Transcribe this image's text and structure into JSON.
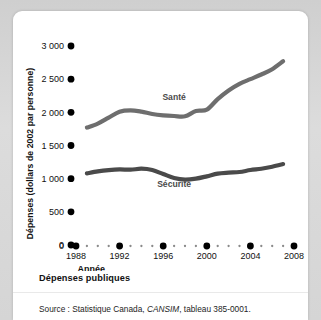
{
  "card": {
    "title": "Dépenses publiques",
    "source_prefix": "Source : Statistique Canada, ",
    "source_italic": "CANSIM",
    "source_suffix": ", tableau 385-0001."
  },
  "chart_data": {
    "type": "line",
    "title": "Dépenses publiques",
    "xlabel": "Année",
    "ylabel": "Dépenses (dollars de 2002 par personne)",
    "xlim": [
      1988,
      2008
    ],
    "ylim": [
      0,
      3000
    ],
    "ytick_labels": [
      "0",
      "500",
      "1 000",
      "1 500",
      "2 000",
      "2 500",
      "3 000"
    ],
    "ytick_values": [
      0,
      500,
      1000,
      1500,
      2000,
      2500,
      3000
    ],
    "xtick_labels": [
      "1988",
      "1992",
      "1996",
      "2000",
      "2004",
      "2008"
    ],
    "xtick_values": [
      1988,
      1992,
      1996,
      2000,
      2004,
      2008
    ],
    "grid": false,
    "legend_position": "inline-labels",
    "marker_style": "dot-ticks",
    "series": [
      {
        "name": "Santé",
        "color": "#6e6e6e",
        "label_x": 1997,
        "label_y": 2180,
        "x": [
          1989,
          1990,
          1991,
          1992,
          1993,
          1994,
          1995,
          1996,
          1997,
          1998,
          1999,
          2000,
          2001,
          2002,
          2003,
          2004,
          2005,
          2006,
          2007
        ],
        "values": [
          1770,
          1830,
          1920,
          2010,
          2030,
          2010,
          1975,
          1955,
          1945,
          1940,
          2020,
          2040,
          2200,
          2330,
          2430,
          2500,
          2570,
          2650,
          2770
        ]
      },
      {
        "name": "Sécurité",
        "color": "#4a4a4a",
        "label_x": 1997,
        "label_y": 870,
        "x": [
          1989,
          1990,
          1991,
          1992,
          1993,
          1994,
          1995,
          1996,
          1997,
          1998,
          1999,
          2000,
          2001,
          2002,
          2003,
          2004,
          2005,
          2006,
          2007
        ],
        "values": [
          1080,
          1110,
          1130,
          1140,
          1135,
          1150,
          1130,
          1070,
          1010,
          985,
          1000,
          1035,
          1075,
          1090,
          1100,
          1130,
          1150,
          1180,
          1220
        ]
      }
    ]
  }
}
